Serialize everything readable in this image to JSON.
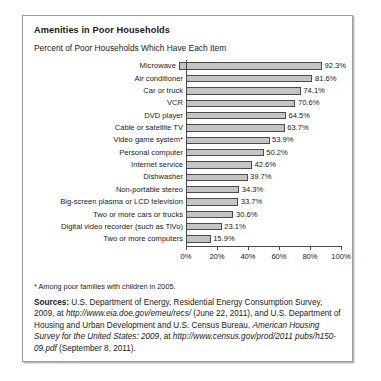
{
  "figure": {
    "title": "Amenities in Poor Households",
    "subtitle": "Percent of Poor Households Which Have Each Item",
    "footnote": "* Among poor families with children in 2005.",
    "sources": {
      "label": "Sources:",
      "part1": " U.S. Department of Energy, Residential Energy Consumption Survey, 2009, at ",
      "url1": "http://www.eia.doe.gov/emeu/recs/",
      "part2": " (June 22, 2011), and U.S. Department of Housing and Urban Development and U.S. Census Bureau, ",
      "pub2": "American Housing Survey for the United States: 2009",
      "part3": ", at ",
      "url2": "http://www.census.gov/prod/2011 pubs/h150-09.pdf",
      "part4": " (September 8, 2011)."
    }
  },
  "chart_data": {
    "type": "bar",
    "orientation": "horizontal",
    "title": "Amenities in Poor Households",
    "subtitle": "Percent of Poor Households Which Have Each Item",
    "xlabel": "",
    "ylabel": "",
    "xlim": [
      0,
      100
    ],
    "xticks": [
      "0%",
      "20%",
      "40%",
      "60%",
      "80%",
      "100%"
    ],
    "xtick_values": [
      0,
      20,
      40,
      60,
      80,
      100
    ],
    "grid": false,
    "legend": "none",
    "bar_color": "#c4c4c4",
    "bar_edge_color": "#4a4a4a",
    "categories": [
      "Microwave",
      "Air conditioner",
      "Car or truck",
      "VCR",
      "DVD player",
      "Cable or satellite TV",
      "Video game system*",
      "Personal computer",
      "Internet service",
      "Dishwasher",
      "Non-portable stereo",
      "Big-screen plasma or LCD television",
      "Two or more cars or trucks",
      "Digital video recorder (such as TiVo)",
      "Two or more computers"
    ],
    "values": [
      92.3,
      81.6,
      74.1,
      70.6,
      64.5,
      63.7,
      53.9,
      50.2,
      42.6,
      39.7,
      34.3,
      33.7,
      30.6,
      23.1,
      15.9
    ],
    "value_labels": [
      "92.3%",
      "81.6%",
      "74.1%",
      "70.6%",
      "64.5%",
      "63.7%",
      "53.9%",
      "50.2%",
      "42.6%",
      "39.7%",
      "34.3%",
      "33.7%",
      "30.6%",
      "23.1%",
      "15.9%"
    ]
  }
}
